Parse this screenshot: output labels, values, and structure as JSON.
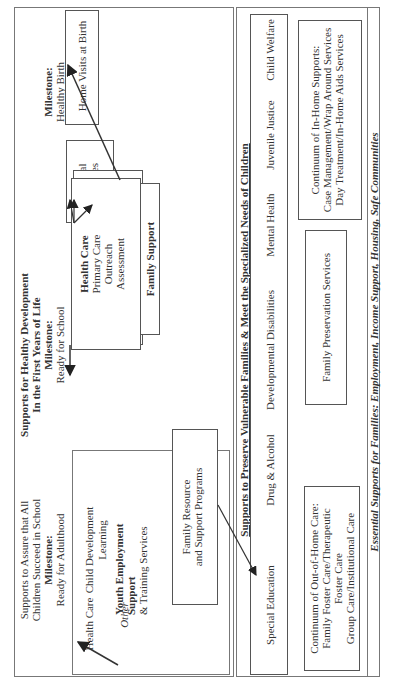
{
  "top_section": {
    "early_years": {
      "title_line1": "Supports for Healthy Development",
      "title_line2": "In the First Years of Life",
      "milestone1_label": "Milestone:",
      "milestone1_value": "Healthy Birth",
      "prenatal": "Prenatal Services",
      "prenatal_line1": "Prenatal",
      "prenatal_line2": "Services",
      "home_visits": "Home Visits at Birth",
      "milestone2_label": "Milestone:",
      "milestone2_value": "Ready for School",
      "health_care_title": "Health Care",
      "health_care_items": [
        "Primary Care",
        "Outreach",
        "Assessment"
      ],
      "family_support": "Family Support"
    },
    "school_years": {
      "title_line1": "Supports to Assure that All",
      "title_line2": "Children Succeed in School",
      "milestone_label": "Milestone:",
      "milestone_value": "Ready for Adulthood",
      "child_development": "Child Development",
      "health_care": "Health Care",
      "learning": "Learning",
      "youth_line1": "Youth Employment",
      "youth_line2": "Support",
      "youth_line3": "& Training Services",
      "other": "Other",
      "family_resource_line1": "Family Resource",
      "family_resource_line2": "and Support Programs"
    }
  },
  "vulnerable_section": {
    "title": "Supports to Preserve Vulnerable Families & Meet the Specialized Needs of Children",
    "systems": [
      "Child Welfare",
      "Juvenile Justice",
      "Mental Health",
      "Developmental Disabilities",
      "Drug & Alcohol",
      "Special Education"
    ],
    "in_home": {
      "line1": "Continuum of In-Home Supports:",
      "line2": "Case Management/Wrap Around Services",
      "line3": "Day Treatment/In-Home Aids Services"
    },
    "family_preservation": "Family Preservation Services",
    "out_of_home": {
      "line1": "Continuum of Out-of-Home Care:",
      "line2": "Family Foster Care/Therapeutic",
      "line3": "Foster Care",
      "line4": "Group Care/Institutional Care"
    }
  },
  "footer": {
    "essential_supports": "Essential Supports for Families:  Employment, Income Support, Housing, Safe Communities"
  },
  "colors": {
    "ink": "#333333",
    "frame": "#777777",
    "background": "#ffffff"
  }
}
